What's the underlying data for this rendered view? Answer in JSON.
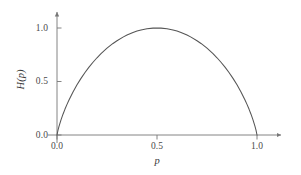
{
  "chart_data": {
    "type": "line",
    "title": "",
    "subtitle": "",
    "xlabel": "p",
    "ylabel": "H(p)",
    "xlim": [
      0.0,
      1.0
    ],
    "ylim": [
      0.0,
      1.0
    ],
    "xticks": [
      "0.0",
      "0.5",
      "1.0"
    ],
    "xtick_values": [
      0.0,
      0.5,
      1.0
    ],
    "yticks": [
      "0.0",
      "0.5",
      "1.0"
    ],
    "ytick_values": [
      0.0,
      0.5,
      1.0
    ],
    "grid": false,
    "legend": "none",
    "axis_style": "arrow-tipped",
    "series": [
      {
        "name": "H(p)",
        "color": "#555555",
        "x": [
          0.0,
          0.005,
          0.01,
          0.02,
          0.03,
          0.04,
          0.05,
          0.06,
          0.08,
          0.1,
          0.12,
          0.14,
          0.16,
          0.18,
          0.2,
          0.22,
          0.25,
          0.28,
          0.3,
          0.33,
          0.35,
          0.38,
          0.4,
          0.42,
          0.45,
          0.48,
          0.5,
          0.52,
          0.55,
          0.58,
          0.6,
          0.62,
          0.65,
          0.67,
          0.7,
          0.72,
          0.75,
          0.78,
          0.8,
          0.82,
          0.84,
          0.86,
          0.88,
          0.9,
          0.92,
          0.94,
          0.95,
          0.96,
          0.97,
          0.98,
          0.99,
          0.995,
          1.0
        ],
        "y": [
          0.0,
          0.0454,
          0.0808,
          0.1414,
          0.1944,
          0.2423,
          0.2864,
          0.3274,
          0.4022,
          0.469,
          0.5294,
          0.5842,
          0.6343,
          0.6801,
          0.7219,
          0.7602,
          0.8113,
          0.8555,
          0.8813,
          0.9149,
          0.9341,
          0.958,
          0.971,
          0.9815,
          0.9928,
          0.9988,
          1.0,
          0.9988,
          0.9928,
          0.9815,
          0.971,
          0.958,
          0.9341,
          0.9149,
          0.8813,
          0.8555,
          0.8113,
          0.7602,
          0.7219,
          0.6801,
          0.6343,
          0.5842,
          0.5294,
          0.469,
          0.4022,
          0.3274,
          0.2864,
          0.2423,
          0.1944,
          0.1414,
          0.0808,
          0.0454,
          0.0
        ]
      }
    ],
    "peak": {
      "x": 0.5,
      "y": 1.0
    },
    "zeros": [
      0.0,
      1.0
    ]
  },
  "axes": {
    "x_title": "p",
    "y_title": "H(p)",
    "x_tick_labels": [
      "0.0",
      "0.5",
      "1.0"
    ],
    "y_tick_labels": [
      "0.0",
      "0.5",
      "1.0"
    ]
  },
  "colors": {
    "curve": "#555555",
    "axis": "#777777",
    "tick": "#777777",
    "text": "#3a3a3a",
    "background": "#ffffff"
  }
}
